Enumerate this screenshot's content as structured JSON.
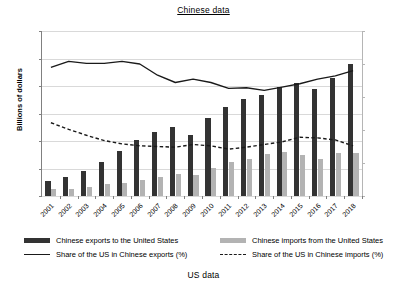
{
  "figure": {
    "title": "Chinese data",
    "caption": "US data"
  },
  "chart_data": {
    "type": "bar",
    "title": "Chinese data",
    "subtitle": "US data",
    "xlabel": "",
    "ylabel": "Billions of dollars",
    "ylabel_secondary": "",
    "grid": true,
    "legend_position": "bottom",
    "ylim": [
      0,
      600
    ],
    "ylim_secondary": [
      0,
      25
    ],
    "yticks": [
      "0",
      "100",
      "200",
      "300",
      "400",
      "500",
      "600"
    ],
    "yticks_secondary": [
      "0%",
      "5%",
      "10%",
      "15%",
      "20%",
      "25%"
    ],
    "categories": [
      "2001",
      "2002",
      "2003",
      "2004",
      "2005",
      "2006",
      "2007",
      "2008",
      "2009",
      "2010",
      "2011",
      "2012",
      "2013",
      "2014",
      "2015",
      "2016",
      "2017",
      "2018"
    ],
    "series": [
      {
        "name": "Chinese exports to the United States",
        "type": "bar",
        "axis": "left",
        "unit": "Billions of dollars",
        "color": "#333333",
        "values": [
          54,
          70,
          92,
          125,
          163,
          203,
          233,
          252,
          221,
          283,
          325,
          352,
          369,
          397,
          410,
          389,
          430,
          479
        ]
      },
      {
        "name": "Chinese imports from the United States",
        "type": "bar",
        "axis": "left",
        "unit": "Billions of dollars",
        "color": "#b3b3b3",
        "values": [
          26,
          27,
          34,
          45,
          49,
          59,
          69,
          81,
          78,
          102,
          122,
          133,
          153,
          159,
          149,
          134,
          155,
          155
        ]
      },
      {
        "name": "Share of the US in Chinese exports (%)",
        "type": "line",
        "axis": "right",
        "unit": "%",
        "style": "solid",
        "color": "#1a1a1a",
        "values": [
          19.5,
          20.4,
          20.1,
          20.1,
          20.4,
          20.0,
          18.3,
          17.2,
          17.7,
          17.2,
          16.3,
          16.4,
          16.0,
          16.5,
          17.0,
          17.7,
          18.2,
          19.0
        ]
      },
      {
        "name": "Share of the US in Chinese imports (%)",
        "type": "line",
        "axis": "right",
        "unit": "%",
        "style": "dashed",
        "color": "#1a1a1a",
        "values": [
          11.1,
          10.1,
          9.2,
          8.4,
          7.9,
          7.6,
          7.5,
          7.4,
          7.8,
          7.6,
          7.1,
          7.4,
          7.8,
          8.2,
          8.9,
          8.8,
          8.5,
          7.6
        ]
      }
    ]
  },
  "legend": {
    "items": [
      {
        "label": "Chinese exports to the United States",
        "marker": "dark-swatch"
      },
      {
        "label": "Chinese imports from the United States",
        "marker": "light-swatch"
      },
      {
        "label": "Share of the US in Chinese exports (%)",
        "marker": "solid-line"
      },
      {
        "label": "Share of the US in Chinese imports (%)",
        "marker": "dashed-line"
      }
    ]
  },
  "axes": {
    "left_title": "Billions of dollars"
  }
}
